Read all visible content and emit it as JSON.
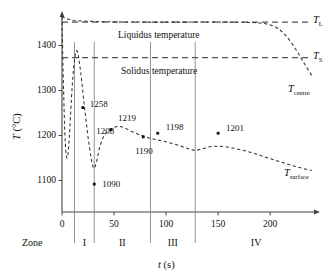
{
  "chart_data": {
    "type": "line",
    "title": "",
    "xlabel": "t (s)",
    "ylabel": "T (°C)",
    "xlim": [
      0,
      245
    ],
    "ylim": [
      1030,
      1470
    ],
    "xticks": [
      0,
      50,
      100,
      150,
      200
    ],
    "yticks": [
      1100,
      1200,
      1300,
      1400
    ],
    "grid": false,
    "legend_position": "right-inline",
    "annotations": {
      "liquidus_band_label": "Liquidus temperature",
      "solidus_band_label": "Solidus temperature",
      "zone_row_label": "Zone",
      "zones": [
        "I",
        "II",
        "III",
        "IV"
      ],
      "zone_boundaries": [
        12,
        31,
        85,
        128,
        245
      ]
    },
    "reference_lines": [
      {
        "name": "T_L",
        "label": "T",
        "sub": "L",
        "value": 1452
      },
      {
        "name": "T_S",
        "label": "T",
        "sub": "S",
        "value": 1373
      }
    ],
    "series": [
      {
        "name": "T_centre",
        "label": "T",
        "sub": "centre",
        "style": "dashed",
        "x": [
          0,
          2,
          4,
          8,
          14,
          40,
          80,
          120,
          160,
          190,
          205,
          215,
          225,
          232,
          240
        ],
        "y": [
          1465,
          1462,
          1460,
          1457,
          1455,
          1453,
          1452,
          1452,
          1452,
          1450,
          1441,
          1422,
          1390,
          1363,
          1333
        ]
      },
      {
        "name": "T_surface",
        "label": "T",
        "sub": "surface",
        "style": "dashed",
        "x": [
          0,
          1,
          3,
          5,
          7,
          9,
          11,
          13,
          15,
          18,
          22,
          26,
          30,
          33,
          36,
          40,
          45,
          50,
          55,
          60,
          66,
          72,
          78,
          84,
          90,
          100,
          112,
          122,
          128,
          134,
          142,
          150,
          160,
          172,
          185,
          198,
          212,
          226,
          240
        ],
        "y": [
          1465,
          1350,
          1190,
          1150,
          1195,
          1280,
          1345,
          1382,
          1385,
          1340,
          1255,
          1180,
          1129,
          1140,
          1172,
          1198,
          1211,
          1218,
          1220,
          1217,
          1210,
          1204,
          1199,
          1194,
          1191,
          1186,
          1178,
          1170,
          1167,
          1170,
          1175,
          1176,
          1174,
          1168,
          1160,
          1150,
          1140,
          1130,
          1122
        ]
      }
    ],
    "points": [
      {
        "label": "1258",
        "x": 20,
        "y": 1262,
        "label_dx": 7,
        "label_dy": -3
      },
      {
        "label": "1208",
        "x": 28,
        "y": 1208,
        "label_dx": 5,
        "label_dy": 0,
        "marker": false
      },
      {
        "label": "1090",
        "x": 31,
        "y": 1092,
        "label_dx": 8,
        "label_dy": 1
      },
      {
        "label": "1219",
        "x": 47,
        "y": 1213,
        "label_dx": 7,
        "label_dy": -11
      },
      {
        "label": "1190",
        "x": 78,
        "y": 1197,
        "label_dx": -8,
        "label_dy": 15
      },
      {
        "label": "1198",
        "x": 92,
        "y": 1205,
        "label_dx": 8,
        "label_dy": -5
      },
      {
        "label": "1201",
        "x": 150,
        "y": 1205,
        "label_dx": 8,
        "label_dy": -4
      }
    ]
  },
  "axes": {
    "ylabel_main": "T",
    "ylabel_unit": " (°C)",
    "xlabel_main": "t",
    "xlabel_unit": " (s)"
  },
  "colors": {
    "axis": "#444444",
    "curve": "#333333",
    "reference": "#555555",
    "text": "#101010",
    "background": "#ffffff"
  }
}
